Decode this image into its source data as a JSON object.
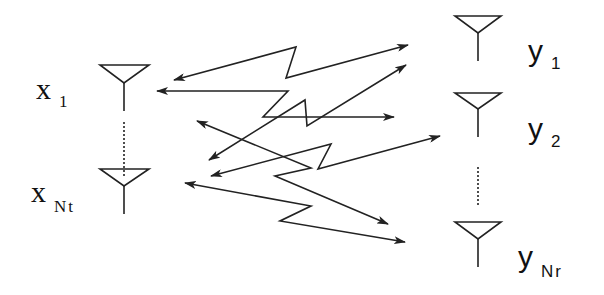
{
  "diagram": {
    "type": "MIMO antenna channel diagram",
    "transmitters": [
      {
        "label": "x",
        "subscript": "1"
      },
      {
        "label": "x",
        "subscript": "Nt"
      }
    ],
    "receivers": [
      {
        "label": "y",
        "subscript": "1"
      },
      {
        "label": "y",
        "subscript": "2"
      },
      {
        "label": "y",
        "subscript": "Nr"
      }
    ],
    "links": 6,
    "colors": {
      "stroke": "#222222",
      "background": "#ffffff"
    }
  }
}
